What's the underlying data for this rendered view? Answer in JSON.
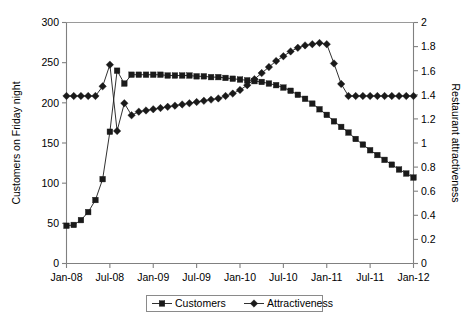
{
  "chart_data": {
    "type": "line",
    "title": "",
    "xlabel": "",
    "ylabel": "Customers on Friday night",
    "y2label": "Restaurant attractiveness",
    "grid": false,
    "legend_position": "bottom",
    "xlim": [
      0,
      48
    ],
    "ylim": [
      0,
      300
    ],
    "y2lim": [
      0,
      2
    ],
    "xtick_labels": [
      "Jan-08",
      "Jul-08",
      "Jan-09",
      "Jul-09",
      "Jan-10",
      "Jul-10",
      "Jan-11",
      "Jul-11",
      "Jan-12"
    ],
    "xtick_values": [
      0,
      6,
      12,
      18,
      24,
      30,
      36,
      42,
      48
    ],
    "ytick_labels": [
      "0",
      "50",
      "100",
      "150",
      "200",
      "250",
      "300"
    ],
    "ytick_values": [
      0,
      50,
      100,
      150,
      200,
      250,
      300
    ],
    "y2tick_labels": [
      "0",
      "0.2",
      "0.4",
      "0.6",
      "0.8",
      "1",
      "1.2",
      "1.4",
      "1.6",
      "1.8",
      "2"
    ],
    "y2tick_values": [
      0,
      0.2,
      0.4,
      0.6,
      0.8,
      1,
      1.2,
      1.4,
      1.6,
      1.8,
      2
    ],
    "x": [
      0,
      1,
      2,
      3,
      4,
      5,
      6,
      7,
      8,
      9,
      10,
      11,
      12,
      13,
      14,
      15,
      16,
      17,
      18,
      19,
      20,
      21,
      22,
      23,
      24,
      25,
      26,
      27,
      28,
      29,
      30,
      31,
      32,
      33,
      34,
      35,
      36,
      37,
      38,
      39,
      40,
      41,
      42,
      43,
      44,
      45,
      46,
      47,
      48
    ],
    "series": [
      {
        "name": "Customers",
        "axis": "left",
        "marker": "square",
        "color": "#1a1a1a",
        "values": [
          47,
          48,
          54,
          64,
          79,
          105,
          164,
          240,
          224,
          235,
          235,
          235,
          235,
          235,
          234,
          234,
          234,
          234,
          233,
          233,
          232,
          232,
          231,
          230,
          229,
          228,
          227,
          226,
          224,
          222,
          219,
          215,
          210,
          205,
          199,
          192,
          185,
          177,
          170,
          163,
          155,
          148,
          141,
          135,
          129,
          123,
          117,
          112,
          107
        ]
      },
      {
        "name": "Attractiveness",
        "axis": "right",
        "marker": "diamond",
        "color": "#1a1a1a",
        "values": [
          1.39,
          1.39,
          1.39,
          1.39,
          1.39,
          1.47,
          1.65,
          1.1,
          1.33,
          1.23,
          1.26,
          1.27,
          1.28,
          1.29,
          1.3,
          1.31,
          1.32,
          1.33,
          1.34,
          1.35,
          1.36,
          1.37,
          1.39,
          1.41,
          1.44,
          1.48,
          1.53,
          1.58,
          1.63,
          1.68,
          1.72,
          1.76,
          1.79,
          1.81,
          1.82,
          1.83,
          1.82,
          1.66,
          1.49,
          1.39,
          1.39,
          1.39,
          1.39,
          1.39,
          1.39,
          1.39,
          1.39,
          1.39,
          1.39
        ]
      }
    ]
  },
  "legend": {
    "items": [
      {
        "label": "Customers",
        "marker": "square"
      },
      {
        "label": "Attractiveness",
        "marker": "diamond"
      }
    ]
  },
  "axes": {
    "left_title": "Customers on Friday night",
    "right_title": "Restaurant attractiveness"
  }
}
